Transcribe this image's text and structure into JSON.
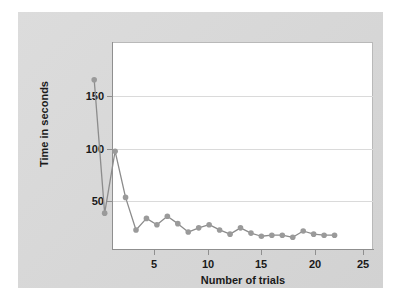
{
  "figure": {
    "background_color": "#ffffff",
    "panel_color": "#d9d9d9",
    "plot_background": "#ffffff"
  },
  "chart_data": {
    "type": "line",
    "title": "",
    "subtitle": "",
    "xlabel": "Number of trials",
    "ylabel": "Time in seconds",
    "x": [
      1,
      2,
      3,
      4,
      5,
      6,
      7,
      8,
      9,
      10,
      11,
      12,
      13,
      14,
      15,
      16,
      17,
      18,
      19,
      20,
      21,
      22,
      23,
      24
    ],
    "values": [
      154,
      27,
      86,
      42,
      11,
      22,
      16,
      24,
      17,
      9,
      13,
      16,
      11,
      7,
      13,
      8,
      5,
      6,
      6,
      4,
      10,
      7,
      6,
      6
    ],
    "series": [
      {
        "name": "Time in seconds",
        "values": [
          154,
          27,
          86,
          42,
          11,
          22,
          16,
          24,
          17,
          9,
          13,
          16,
          11,
          7,
          13,
          8,
          5,
          6,
          6,
          4,
          10,
          7,
          6,
          6
        ],
        "color": "#8c8c8c",
        "marker": "circle",
        "marker_color": "#9a9a9a"
      }
    ],
    "xlim": [
      0.2,
      25.5
    ],
    "ylim": [
      0,
      198
    ],
    "xticks": [
      5,
      10,
      15,
      20,
      25
    ],
    "xtick_labels": [
      "5",
      "10",
      "15",
      "20",
      "25"
    ],
    "yticks": [
      50,
      100,
      150
    ],
    "ytick_labels": [
      "50",
      "100",
      "150"
    ],
    "grid": {
      "horizontal": true,
      "vertical": false,
      "color": "#dadada"
    },
    "legend": {
      "visible": false,
      "position": "none"
    },
    "annotations": []
  }
}
